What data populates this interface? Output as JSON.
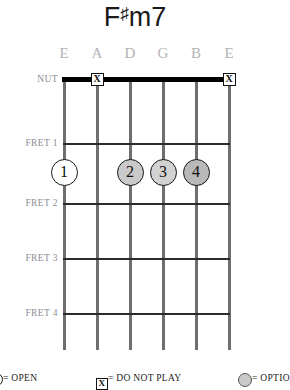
{
  "chord": {
    "root": "F",
    "accidental": "♯",
    "quality": "m7",
    "title_plain": "F#m7"
  },
  "string_labels": [
    "E",
    "A",
    "D",
    "G",
    "B",
    "E"
  ],
  "fret_labels": [
    "NUT",
    "FRET 1",
    "FRET 2",
    "FRET 3",
    "FRET 4"
  ],
  "nut_markers": [
    {
      "symbol": "X",
      "string_index": 1,
      "meaning": "do-not-play"
    },
    {
      "symbol": "X",
      "string_index": 5,
      "meaning": "do-not-play"
    }
  ],
  "finger_dots": [
    {
      "label": "1",
      "string_index": 0,
      "fret": 1,
      "fill": "#ffffff"
    },
    {
      "label": "2",
      "string_index": 2,
      "fret": 1,
      "fill": "#c9c9c9"
    },
    {
      "label": "3",
      "string_index": 3,
      "fill": "#d2d2d2",
      "fret": 1
    },
    {
      "label": "4",
      "string_index": 4,
      "fret": 1,
      "fill": "#b9b9b9"
    }
  ],
  "legend": [
    {
      "symbol": "",
      "text": "= OPEN",
      "kind": "open"
    },
    {
      "symbol": "X",
      "text": "= DO NOT PLAY",
      "kind": "mute"
    },
    {
      "symbol": "",
      "text": "= OPTIO",
      "kind": "optional"
    }
  ],
  "colors": {
    "string": "#6e6e6e",
    "nut": "#000000",
    "fret": "#2b2b2b",
    "label_gray": "#8e8e93",
    "string_label_gray": "#b4b4b4",
    "title": "#1a1a1a",
    "background": "#ffffff"
  },
  "geometry": {
    "string_x": [
      64,
      97,
      130,
      163,
      196,
      229
    ],
    "nut_y": 79,
    "fret_y": [
      143,
      203,
      258,
      313
    ],
    "string_bottom_y": 350,
    "dot_row_y": 172,
    "string_label_y": 45
  }
}
